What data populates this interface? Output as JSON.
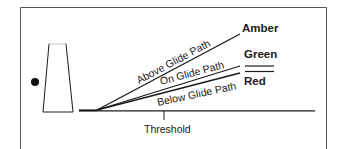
{
  "diagram": {
    "type": "PAPI / VASI glide path indicator diagram",
    "colors": {
      "stroke": "#1a1a1a",
      "frame": "#555555",
      "background": "#ffffff"
    },
    "lights": {
      "amber": "Amber",
      "green": "Green",
      "red": "Red"
    },
    "paths": {
      "above": "Above Glide Path",
      "on": "On Glide Path",
      "below": "Below Glide Path"
    },
    "runway": {
      "threshold_label": "Threshold"
    }
  }
}
